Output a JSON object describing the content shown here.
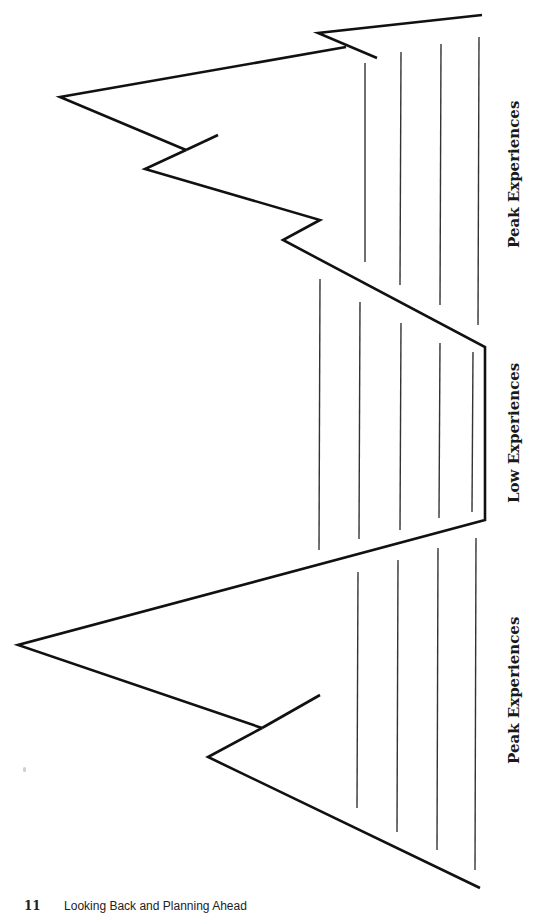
{
  "diagram": {
    "labels": [
      {
        "id": "peak-top",
        "text": "Peak Experiences"
      },
      {
        "id": "low-middle",
        "text": "Low Experiences"
      },
      {
        "id": "peak-bottom",
        "text": "Peak Experiences"
      }
    ],
    "colors": {
      "outline": "#111111",
      "lines": "#333333",
      "background": "#ffffff"
    }
  },
  "footer": {
    "page_number": "11",
    "book_title": "Looking Back and Planning Ahead"
  }
}
